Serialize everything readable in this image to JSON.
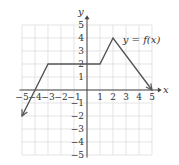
{
  "chart_data": {
    "type": "line",
    "title": "",
    "curve_label": "y = f(x)",
    "xlabel": "x",
    "ylabel": "y",
    "xlim": [
      -5,
      5
    ],
    "ylim": [
      -5,
      5
    ],
    "grid": true,
    "x_ticks": [
      -5,
      -4,
      -3,
      -2,
      -1,
      1,
      2,
      3,
      4,
      5
    ],
    "y_ticks": [
      5,
      4,
      3,
      2,
      1,
      -1,
      -2,
      -3,
      -4,
      -5
    ],
    "series": [
      {
        "name": "f(x)",
        "points": [
          [
            -5,
            -2
          ],
          [
            -4,
            0
          ],
          [
            -3,
            2
          ],
          [
            1,
            2
          ],
          [
            2,
            4
          ],
          [
            5,
            0
          ]
        ],
        "arrow_start": true,
        "arrow_end": true
      }
    ],
    "colors": {
      "curve": "#555555",
      "grid": "#d8d8d8",
      "axis": "#444444"
    }
  }
}
